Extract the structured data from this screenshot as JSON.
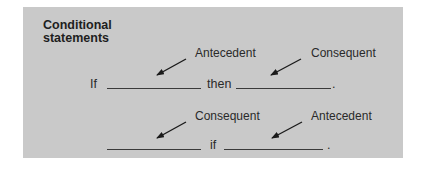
{
  "title": "Conditional statements",
  "row1": {
    "label_left": "Antecedent",
    "label_right": "Consequent",
    "word_start": "If",
    "word_mid": "then",
    "end_punct": "."
  },
  "row2": {
    "label_left": "Consequent",
    "label_right": "Antecedent",
    "word_mid": "if",
    "end_punct": "."
  },
  "colors": {
    "panel": "#c9c9c9",
    "text": "#232323",
    "arrow": "#1a1a1a"
  }
}
